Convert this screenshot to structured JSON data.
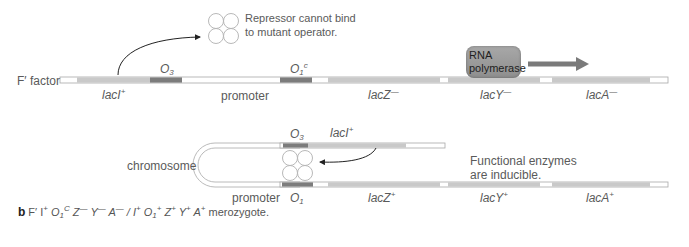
{
  "panel_a": {
    "molecule_label": "F′ factor",
    "segments": [
      {
        "name": "lacI",
        "label": "lacI",
        "allele": "+"
      },
      {
        "name": "O3",
        "label": "O",
        "sub": "3"
      },
      {
        "name": "promoter",
        "label": "promoter"
      },
      {
        "name": "O1c",
        "label": "O",
        "sub": "1",
        "sup": "c"
      },
      {
        "name": "lacZ",
        "label": "lacZ",
        "allele": "—"
      },
      {
        "name": "lacY",
        "label": "lacY",
        "allele": "—"
      },
      {
        "name": "lacA",
        "label": "lacA",
        "allele": "—"
      }
    ],
    "repressor_note_line1": "Repressor cannot bind",
    "repressor_note_line2": "to mutant operator.",
    "rnap_line1": "RNA",
    "rnap_line2": "polymerase"
  },
  "panel_b": {
    "molecule_label": "chromosome",
    "segments": [
      {
        "name": "O3",
        "label": "O",
        "sub": "3"
      },
      {
        "name": "lacI",
        "label": "lacI",
        "allele": "+"
      },
      {
        "name": "promoter",
        "label": "promoter"
      },
      {
        "name": "O1",
        "label": "O",
        "sub": "1"
      },
      {
        "name": "lacZ",
        "label": "lacZ",
        "allele": "+"
      },
      {
        "name": "lacY",
        "label": "lacY",
        "allele": "+"
      },
      {
        "name": "lacA",
        "label": "lacA",
        "allele": "+"
      }
    ],
    "enzyme_note_line1": "Functional enzymes",
    "enzyme_note_line2": "are inducible."
  },
  "caption": {
    "panel_letter": "b",
    "genotype": [
      {
        "t": "F′ I",
        "sup": "+"
      },
      {
        "t": " O",
        "sub": "1",
        "sup": "C",
        "ital": true
      },
      {
        "t": " Z",
        "sup": "—",
        "ital": true
      },
      {
        "t": " Y",
        "sup": "—",
        "ital": true
      },
      {
        "t": " A",
        "sup": "—",
        "ital": true
      },
      {
        "t": " / I",
        "sup": "+",
        "ital": true
      },
      {
        "t": " O",
        "sub": "1",
        "sup": "+",
        "ital": true
      },
      {
        "t": " Z",
        "sup": "+",
        "ital": true
      },
      {
        "t": " Y",
        "sup": "+",
        "ital": true
      },
      {
        "t": " A",
        "sup": "+",
        "ital": true
      }
    ],
    "suffix": " merozygote."
  },
  "colors": {
    "gene": "#c8c8c8",
    "operator": "#7a7a7a",
    "outline": "#a0a0a0",
    "arrow": "#7a7a7a",
    "rnap": "#9a9a9a"
  }
}
